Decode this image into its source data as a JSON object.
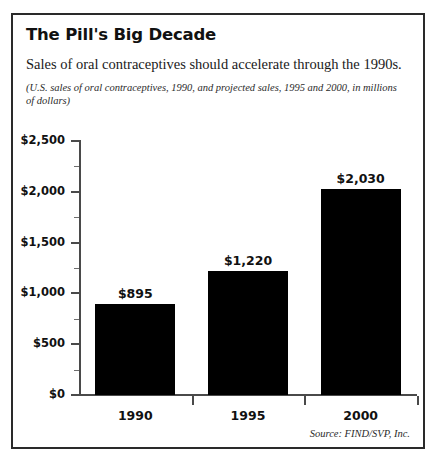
{
  "figure": {
    "title": "The Pill's Big Decade",
    "subtitle": "Sales of oral contraceptives should accelerate through the 1990s.",
    "note": "(U.S. sales of oral contraceptives, 1990, and projected sales, 1995 and 2000, in millions of dollars)",
    "source": "Source: FIND/SVP, Inc.",
    "border_color": "#2a2a2a",
    "bar_color": "#000000",
    "axis_color": "#4a4a4a"
  },
  "chart_data": {
    "type": "bar",
    "title": "The Pill's Big Decade",
    "subtitle": "Sales of oral contraceptives should accelerate through the 1990s.",
    "annotation": "(U.S. sales of oral contraceptives, 1990, and projected sales, 1995 and 2000, in millions of dollars)",
    "source": "Source: FIND/SVP, Inc.",
    "categories": [
      "1990",
      "1995",
      "2000"
    ],
    "values": [
      895,
      1220,
      2030
    ],
    "value_labels": [
      "$895",
      "$1,220",
      "$2,030"
    ],
    "xlabel": "",
    "ylabel": "",
    "ylim": [
      0,
      2500
    ],
    "ytick_values": [
      0,
      500,
      1000,
      1500,
      2000,
      2500
    ],
    "ytick_labels": [
      "$0",
      "$500",
      "$1,000",
      "$1,500",
      "$2,000",
      "$2,500"
    ],
    "yminor_values": [
      250,
      750,
      1250,
      1750,
      2250
    ],
    "grid": false,
    "legend": false,
    "units": "millions of dollars"
  }
}
